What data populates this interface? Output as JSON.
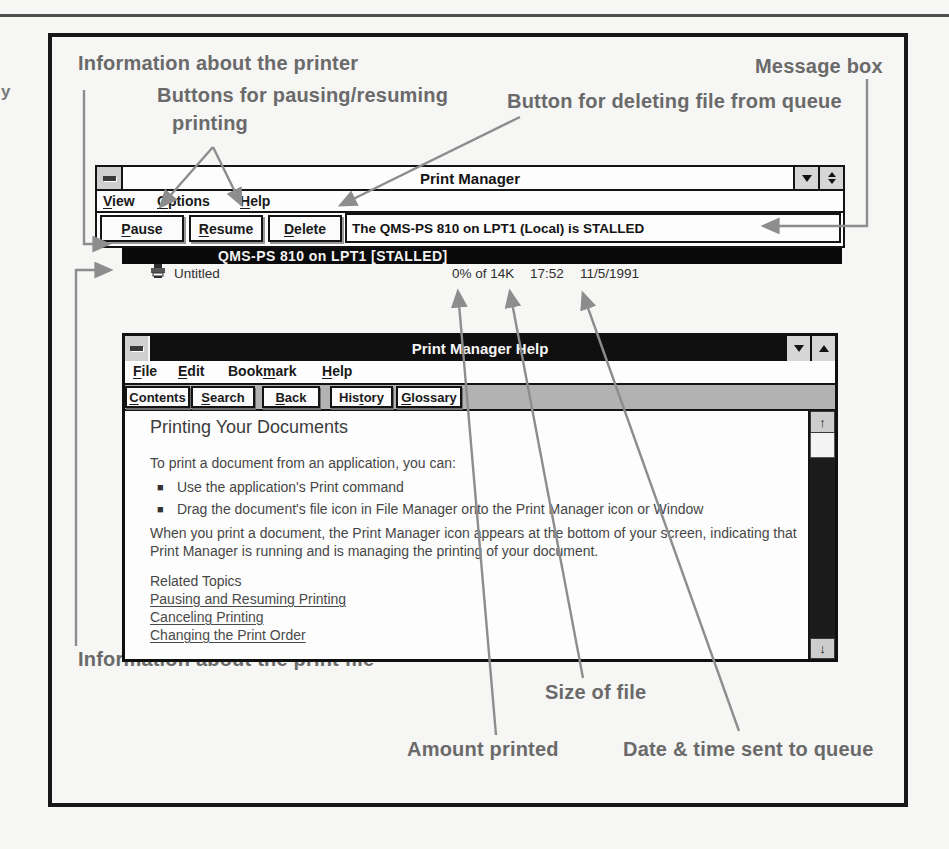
{
  "page": {
    "margin_fragment": "y"
  },
  "colors": {
    "callout_text": "#6a6a6a",
    "arrow_line": "#8d8d8d",
    "active_titlebar_bg": "#101010",
    "selected_row_bg": "#0a0a0a",
    "window_bg": "#fdfdfd"
  },
  "callouts": {
    "printer_info": "Information about the printer",
    "pause_resume_line1": "Buttons for pausing/resuming",
    "pause_resume_line2": "printing",
    "delete_button": "Button for deleting file from queue",
    "message_box": "Message box",
    "print_file_info": "Information about the print file",
    "file_size": "Size of file",
    "amount_printed": "Amount printed",
    "date_time": "Date & time sent to queue"
  },
  "print_manager": {
    "title": "Print Manager",
    "menus": [
      {
        "label": "View",
        "u": 0
      },
      {
        "label": "Options",
        "u": 0
      },
      {
        "label": "Help",
        "u": 0
      }
    ],
    "buttons": [
      {
        "label": "Pause",
        "u": 0
      },
      {
        "label": "Resume",
        "u": 0
      },
      {
        "label": "Delete",
        "u": 0
      }
    ],
    "status_message": "The QMS-PS 810 on LPT1 (Local) is STALLED",
    "queue": {
      "printer_row": "QMS-PS 810 on LPT1 [STALLED]",
      "job": {
        "name": "Untitled",
        "progress": "0% of 14K",
        "time": "17:52",
        "date": "11/5/1991"
      }
    }
  },
  "help_window": {
    "title": "Print Manager Help",
    "menus": [
      {
        "label": "File",
        "u": 0
      },
      {
        "label": "Edit",
        "u": 0
      },
      {
        "label": "Bookmark",
        "u": 4
      },
      {
        "label": "Help",
        "u": 0
      }
    ],
    "toolbar": [
      {
        "label": "Contents",
        "u": 0
      },
      {
        "label": "Search",
        "u": 0
      },
      {
        "label": "Back",
        "u": 0
      },
      {
        "label": "History",
        "u": 3
      },
      {
        "label": "Glossary",
        "u": 0
      }
    ],
    "content": {
      "heading": "Printing Your Documents",
      "intro": "To print a document from an application, you can:",
      "bullets": [
        "Use the application's Print command",
        "Drag the document's file icon in File Manager onto the Print Manager icon or Window"
      ],
      "paragraph": "When you print a document, the Print Manager icon appears at the bottom of your screen, indicating that Print Manager is running and is managing the printing of your document.",
      "related_heading": "Related Topics",
      "links": [
        "Pausing and Resuming Printing",
        "Canceling Printing",
        "Changing the Print Order"
      ]
    }
  }
}
